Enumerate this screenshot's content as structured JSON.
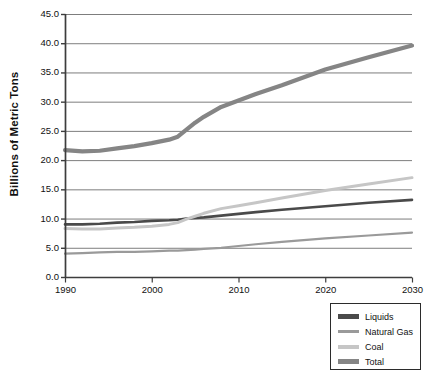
{
  "chart_data": {
    "type": "line",
    "title": "",
    "xlabel": "",
    "ylabel": "Billions of Metric Tons",
    "xlim": [
      1990,
      2030
    ],
    "ylim": [
      0,
      45
    ],
    "grid": true,
    "legend_position": "bottom-right",
    "x_ticks": [
      "1990",
      "2000",
      "2010",
      "2020",
      "2030"
    ],
    "x_tick_values": [
      1990,
      2000,
      2010,
      2020,
      2030
    ],
    "y_ticks": [
      "0.0",
      "5.0",
      "10.0",
      "15.0",
      "20.0",
      "25.0",
      "30.0",
      "35.0",
      "40.0",
      "45.0"
    ],
    "y_tick_values": [
      0,
      5,
      10,
      15,
      20,
      25,
      30,
      35,
      40,
      45
    ],
    "x": [
      1990,
      1992,
      1994,
      1996,
      1998,
      2000,
      2002,
      2003,
      2004,
      2005,
      2006,
      2008,
      2010,
      2012,
      2015,
      2020,
      2025,
      2030
    ],
    "series": [
      {
        "name": "Liquids",
        "color": "#4a4a4a",
        "width": 2.6,
        "values": [
          9.0,
          9.0,
          9.1,
          9.3,
          9.4,
          9.6,
          9.7,
          9.8,
          10.0,
          10.1,
          10.2,
          10.5,
          10.8,
          11.1,
          11.5,
          12.1,
          12.7,
          13.2
        ]
      },
      {
        "name": "Natural Gas",
        "color": "#9a9a9a",
        "width": 2.2,
        "values": [
          4.0,
          4.1,
          4.2,
          4.3,
          4.3,
          4.4,
          4.5,
          4.5,
          4.6,
          4.7,
          4.8,
          5.0,
          5.3,
          5.6,
          6.0,
          6.6,
          7.1,
          7.6
        ]
      },
      {
        "name": "Coal",
        "color": "#c6c6c6",
        "width": 3.0,
        "values": [
          8.3,
          8.2,
          8.2,
          8.4,
          8.5,
          8.7,
          9.0,
          9.3,
          9.9,
          10.4,
          10.9,
          11.7,
          12.2,
          12.7,
          13.5,
          14.8,
          15.9,
          17.0
        ]
      },
      {
        "name": "Total",
        "color": "#858585",
        "width": 4.2,
        "values": [
          21.7,
          21.5,
          21.6,
          22.0,
          22.4,
          22.9,
          23.5,
          24.0,
          25.2,
          26.4,
          27.4,
          29.1,
          30.2,
          31.3,
          32.8,
          35.5,
          37.6,
          39.6
        ]
      }
    ],
    "legend": [
      {
        "label": "Liquids",
        "color": "#4a4a4a",
        "height": 4.5
      },
      {
        "label": "Natural Gas",
        "color": "#9a9a9a",
        "height": 3.0
      },
      {
        "label": "Coal",
        "color": "#c6c6c6",
        "height": 4.0
      },
      {
        "label": "Total",
        "color": "#858585",
        "height": 4.5
      }
    ]
  },
  "plot_geometry": {
    "left": 65,
    "right": 412,
    "top": 14,
    "bottom": 277,
    "axis_color": "#3d3d3d",
    "grid_color": "#6e6e6e",
    "background": "#ffffff"
  }
}
